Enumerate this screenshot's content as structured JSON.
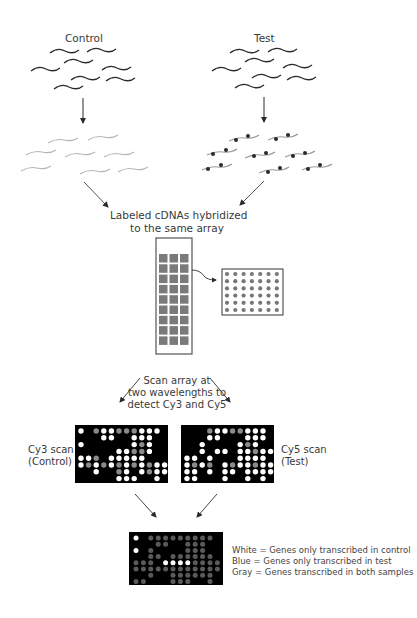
{
  "diagram": {
    "type": "microarray-workflow",
    "samples": {
      "control": {
        "label": "Control"
      },
      "test": {
        "label": "Test"
      }
    },
    "hybridization": {
      "line1": "Labeled cDNAs hybridized",
      "line2": "to the same array"
    },
    "scan": {
      "line1": "Scan array at",
      "line2": "two wavelengths to",
      "line3": "detect Cy3 and Cy5"
    },
    "cy3": {
      "line1": "Cy3 scan",
      "line2": "(Control)"
    },
    "cy5": {
      "line1": "Cy5 scan",
      "line2": "(Test)"
    },
    "legend": {
      "white": "White = Genes only transcribed in control",
      "blue": "Blue = Genes only transcribed in test",
      "gray": "Gray = Genes transcribed in both samples"
    },
    "colors": {
      "stroke": "#2a2a2a",
      "light_strand": "#b5b5b5",
      "array_spot": "#7a7a7a",
      "scan_bg": "#000000",
      "spot_white": "#ffffff",
      "spot_gray": "#8a8a8a",
      "spot_dark_gray": "#5a5a5a"
    },
    "array_grid": {
      "rows": 9,
      "cols": 3
    },
    "zoom_grid": {
      "rows": 6,
      "cols": 7
    }
  }
}
